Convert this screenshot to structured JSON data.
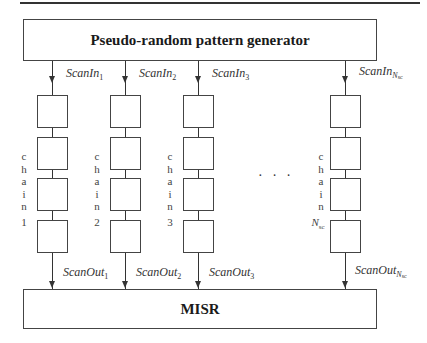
{
  "diagram": {
    "generator_label": "Pseudo-random pattern generator",
    "misr_label": "MISR",
    "ellipsis": "· · ·",
    "chains": [
      {
        "id": "1",
        "in_base": "ScanIn",
        "in_sub": "1",
        "out_base": "ScanOut",
        "out_sub": "1",
        "chain_letters": [
          "c",
          "h",
          "a",
          "i",
          "n"
        ],
        "chain_num": "1",
        "cells": 4
      },
      {
        "id": "2",
        "in_base": "ScanIn",
        "in_sub": "2",
        "out_base": "ScanOut",
        "out_sub": "2",
        "chain_letters": [
          "c",
          "h",
          "a",
          "i",
          "n"
        ],
        "chain_num": "2",
        "cells": 4
      },
      {
        "id": "3",
        "in_base": "ScanIn",
        "in_sub": "3",
        "out_base": "ScanOut",
        "out_sub": "3",
        "chain_letters": [
          "c",
          "h",
          "a",
          "i",
          "n"
        ],
        "chain_num": "3",
        "cells": 4
      },
      {
        "id": "Nsc",
        "in_base": "ScanIn",
        "in_sub": "N",
        "in_subsub": "sc",
        "out_base": "ScanOut",
        "out_sub": "N",
        "out_subsub": "sc",
        "chain_letters": [
          "c",
          "h",
          "a",
          "i",
          "n"
        ],
        "chain_num": "N",
        "chain_num_sub": "sc",
        "cells": 4
      }
    ]
  }
}
